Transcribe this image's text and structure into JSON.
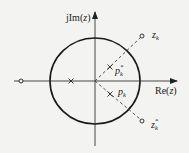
{
  "diagram": {
    "type": "pole-zero plot (z-plane)",
    "axes": {
      "imag_label_prefix": "jIm(",
      "imag_label_var": "z",
      "imag_label_suffix": ")",
      "real_label_prefix": "Re(",
      "real_label_var": "z",
      "real_label_suffix": ")"
    },
    "unit_circle": true,
    "labels": {
      "zk_main": "z",
      "zk_sub": "k",
      "zk_conj_main": "z",
      "zk_conj_sub": "k",
      "zk_conj_sup": "*",
      "pk_main": "p",
      "pk_sub": "k",
      "pk_conj_main": "p",
      "pk_conj_sub": "k",
      "pk_conj_sup": "*"
    },
    "markers": {
      "zeros": [
        "z_k (outside circle, upper right)",
        "z_k* (outside circle, lower right)",
        "zero on negative real axis outside circle"
      ],
      "poles": [
        "p_k* (inside circle, upper)",
        "p_k (inside circle, lower)",
        "pole on negative real axis inside circle"
      ]
    },
    "colors": {
      "stroke": "#222222",
      "background": "#f3f3f1"
    }
  }
}
